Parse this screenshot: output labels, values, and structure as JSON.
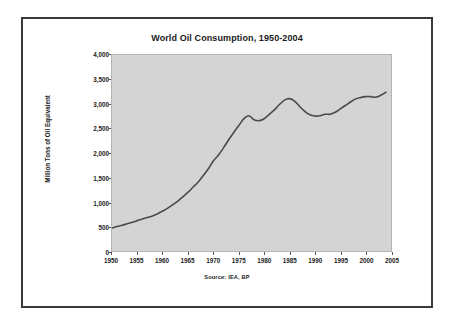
{
  "figure": {
    "source_note": "Source:   IEA, BP",
    "frame_color": "#3a3a3a",
    "page_background": "#ffffff"
  },
  "chart_data": {
    "type": "line",
    "title": "World Oil Consumption, 1950-2004",
    "xlabel": "",
    "ylabel": "Million Tons of Oil Equivalent",
    "xlim": [
      1950,
      2005
    ],
    "ylim": [
      0,
      4000
    ],
    "grid": false,
    "legend": null,
    "plot_background": "#d4d4d4",
    "line_color": "#4a4a4a",
    "line_width": 1.6,
    "xticks": [
      1950,
      1955,
      1960,
      1965,
      1970,
      1975,
      1980,
      1985,
      1990,
      1995,
      2000,
      2005
    ],
    "xtick_labels": [
      "1950",
      "1955",
      "1960",
      "1965",
      "1970",
      "1975",
      "1980",
      "1985",
      "1990",
      "1995",
      "2000",
      "2005"
    ],
    "yticks": [
      0,
      500,
      1000,
      1500,
      2000,
      2500,
      3000,
      3500,
      4000
    ],
    "ytick_labels": [
      "0",
      "500",
      "1,000",
      "1,500",
      "2,000",
      "2,500",
      "3,000",
      "3,500",
      "4,000"
    ],
    "series": [
      {
        "name": "World Oil Consumption",
        "x": [
          1950,
          1951,
          1952,
          1953,
          1954,
          1955,
          1956,
          1957,
          1958,
          1959,
          1960,
          1961,
          1962,
          1963,
          1964,
          1965,
          1966,
          1967,
          1968,
          1969,
          1970,
          1971,
          1972,
          1973,
          1974,
          1975,
          1976,
          1977,
          1978,
          1979,
          1980,
          1981,
          1982,
          1983,
          1984,
          1985,
          1986,
          1987,
          1988,
          1989,
          1990,
          1991,
          1992,
          1993,
          1994,
          1995,
          1996,
          1997,
          1998,
          1999,
          2000,
          2001,
          2002,
          2003,
          2004
        ],
        "values": [
          470,
          500,
          525,
          555,
          585,
          620,
          655,
          685,
          715,
          760,
          815,
          875,
          945,
          1020,
          1110,
          1200,
          1305,
          1410,
          1540,
          1680,
          1840,
          1960,
          2110,
          2270,
          2420,
          2560,
          2700,
          2760,
          2680,
          2660,
          2700,
          2790,
          2880,
          2990,
          3080,
          3110,
          3060,
          2950,
          2850,
          2780,
          2755,
          2760,
          2790,
          2790,
          2830,
          2900,
          2970,
          3040,
          3100,
          3130,
          3150,
          3150,
          3140,
          3180,
          3240
        ]
      }
    ],
    "annotations": []
  }
}
